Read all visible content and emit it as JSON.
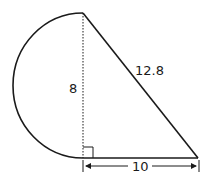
{
  "diagram": {
    "shape": "semicircle attached to right triangle",
    "labels": {
      "height": "8",
      "hypotenuse": "12.8",
      "base": "10"
    },
    "colors": {
      "stroke": "#1a1a1a",
      "background": "#ffffff"
    }
  }
}
